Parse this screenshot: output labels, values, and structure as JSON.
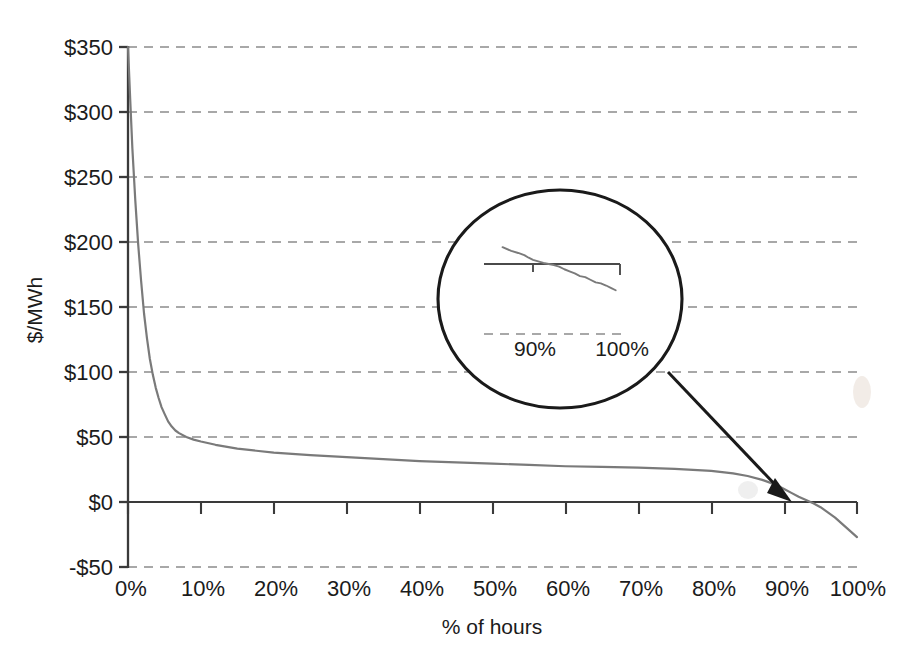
{
  "chart_data": {
    "type": "line",
    "title": "",
    "subtitle": "",
    "xlabel": "% of hours",
    "ylabel": "$/MWh",
    "xlim": [
      0,
      100
    ],
    "ylim": [
      -50,
      350
    ],
    "grid": true,
    "legend": null,
    "x_ticks": [
      "0%",
      "10%",
      "20%",
      "30%",
      "40%",
      "50%",
      "60%",
      "70%",
      "80%",
      "90%",
      "100%"
    ],
    "x_tick_values": [
      0,
      10,
      20,
      30,
      40,
      50,
      60,
      70,
      80,
      90,
      100
    ],
    "y_ticks": [
      "$350",
      "$300",
      "$250",
      "$200",
      "$150",
      "$100",
      "$50",
      "$0",
      "-$50"
    ],
    "y_tick_values": [
      350,
      300,
      250,
      200,
      150,
      100,
      50,
      0,
      -50
    ],
    "series": [
      {
        "name": "price duration curve",
        "color": "#7a7a7a",
        "x": [
          0,
          0.3,
          0.6,
          1.0,
          1.4,
          1.8,
          2.2,
          2.6,
          3.0,
          3.4,
          3.8,
          4.2,
          4.6,
          5.0,
          5.5,
          6.0,
          6.5,
          7.0,
          8.0,
          9.0,
          10.0,
          12.0,
          15.0,
          20.0,
          25.0,
          30.0,
          35.0,
          40.0,
          45.0,
          50.0,
          55.0,
          60.0,
          65.0,
          70.0,
          75.0,
          80.0,
          83.0,
          85.0,
          87.0,
          89.0,
          90.0,
          91.0,
          92.0,
          93.0,
          94.0,
          95.0,
          96.0,
          97.0,
          98.0,
          99.0,
          100.0
        ],
        "y": [
          350,
          310,
          272,
          232,
          198,
          170,
          145,
          126,
          110,
          98,
          88,
          80,
          73,
          68,
          62,
          58,
          55,
          53,
          50,
          48,
          46.5,
          44,
          41,
          38,
          36,
          34.5,
          33,
          31.5,
          30.5,
          29.5,
          28.5,
          27.5,
          27,
          26.5,
          25.5,
          24,
          22,
          20,
          17,
          13,
          10,
          7,
          4,
          1.5,
          -1,
          -4,
          -8,
          -12,
          -17,
          -22,
          -27
        ]
      }
    ],
    "annotations": [
      {
        "type": "magnifier-ellipse",
        "label": "zoom-inset",
        "x_range": [
          "90%",
          "100%"
        ],
        "points_to_x": 92,
        "points_to_y": 0,
        "inset_x_ticks": [
          "90%",
          "100%"
        ],
        "inset_series": {
          "name": "price duration curve (magnified tail)",
          "color": "#7a7a7a",
          "x": [
            86.5,
            87.5,
            88.3,
            89.0,
            89.5,
            90.0,
            90.6,
            91.2,
            91.8,
            92.4,
            93.0,
            93.6,
            94.2,
            94.8,
            95.4,
            96.0,
            96.6,
            97.2,
            97.8,
            98.4,
            99.0,
            99.5
          ],
          "y": [
            16,
            12.5,
            10.5,
            8.5,
            6.0,
            4.0,
            2.5,
            1.0,
            0.0,
            -1.0,
            -2.5,
            -5.0,
            -7.0,
            -9.0,
            -11.5,
            -12.5,
            -15.0,
            -17.5,
            -18.5,
            -20.5,
            -23.0,
            -25.0
          ]
        }
      }
    ]
  },
  "chart": {
    "y_axis_title": "$/MWh",
    "x_axis_title": "% of hours",
    "y_labels": {
      "l350": "$350",
      "l300": "$300",
      "l250": "$250",
      "l200": "$200",
      "l150": "$150",
      "l100": "$100",
      "l50": "$50",
      "l0": "$0",
      "lneg50": "-$50"
    },
    "x_labels": {
      "x0": "0%",
      "x10": "10%",
      "x20": "20%",
      "x30": "30%",
      "x40": "40%",
      "x50": "50%",
      "x60": "60%",
      "x70": "70%",
      "x80": "80%",
      "x90": "90%",
      "x100": "100%"
    },
    "inset": {
      "label_90": "90%",
      "label_100": "100%"
    },
    "colors": {
      "series": "#7a7a7a",
      "axis": "#3a3a3a",
      "grid": "#8c8c8c",
      "text": "#1b1b1b",
      "annotation": "#1a1a1a",
      "background": "#ffffff"
    }
  }
}
